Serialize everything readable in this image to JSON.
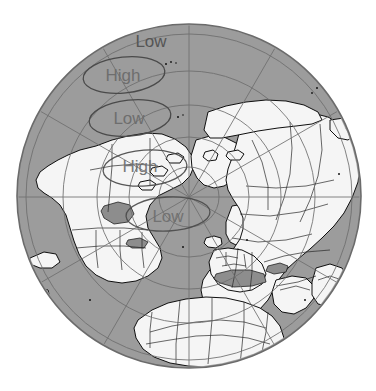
{
  "figure": {
    "background_color": "#ffffff",
    "width": 376,
    "height": 391
  },
  "map": {
    "projection": "polar-stereographic",
    "center_pole": "North Pole",
    "circle": {
      "cx": 189,
      "cy": 196,
      "r": 172
    },
    "pole_point": {
      "x": 189,
      "y": 197
    },
    "colors": {
      "ocean": "#9c9c9c",
      "land": "#f4f4f4",
      "coastline": "#111111",
      "border": "#333333",
      "graticule": "#7a7a7a",
      "limb": "#6b6b6b",
      "shaded_sea": "#8f8f8f"
    },
    "graticule": {
      "meridian_spacing_deg": 30,
      "parallel_spacing_deg": 15,
      "visible": true
    }
  },
  "annotations": {
    "items": [
      {
        "id": "low-top",
        "label": "Low",
        "type": "text-only",
        "has_ellipse": false,
        "x": 151,
        "y": 43,
        "ellipse": null
      },
      {
        "id": "high-upper",
        "label": "High",
        "type": "ellipse-label",
        "has_ellipse": true,
        "x": 123,
        "y": 76,
        "ellipse": {
          "cx": 124,
          "cy": 75,
          "rx": 41,
          "ry": 18,
          "rotate": -6
        }
      },
      {
        "id": "low-middle",
        "label": "Low",
        "type": "ellipse-label",
        "has_ellipse": true,
        "x": 129,
        "y": 119,
        "ellipse": {
          "cx": 130,
          "cy": 118,
          "rx": 41,
          "ry": 18,
          "rotate": -6
        }
      },
      {
        "id": "high-lower",
        "label": "High",
        "type": "ellipse-label",
        "has_ellipse": true,
        "x": 140,
        "y": 167,
        "ellipse": {
          "cx": 145,
          "cy": 168,
          "rx": 42,
          "ry": 18,
          "rotate": -4
        }
      },
      {
        "id": "low-bottom",
        "label": "Low",
        "type": "ellipse-label",
        "has_ellipse": true,
        "x": 168,
        "y": 217,
        "ellipse": {
          "cx": 168,
          "cy": 214,
          "rx": 42,
          "ry": 17,
          "rotate": -3
        }
      }
    ]
  }
}
